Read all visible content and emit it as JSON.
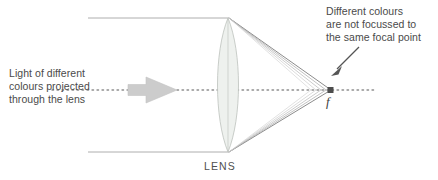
{
  "figure": {
    "background_color": "#ffffff"
  },
  "labels": {
    "left_caption": "Light of different\ncolours projected\nthrough the lens",
    "right_caption": "Different colours\nare not focussed to\nthe same focal point",
    "lens_label": "LENS",
    "focal_label": "f"
  },
  "colors": {
    "text": "#4a4a4a",
    "ray": "#8c8c8c",
    "axis": "#8f8f8f",
    "lens_fill": "#eef1ee",
    "lens_stroke": "#b9bfb9",
    "block_arrow": "#c9c9c9",
    "pointer_arrow": "#555555"
  },
  "geometry": {
    "optical_axis_y": 90,
    "lens_center_x": 228,
    "lens_top_y": 18,
    "lens_bottom_y": 152,
    "lens_half_width": 14,
    "focal_point_x": 331,
    "focal_point_y": 90,
    "incoming_ray_start_x": 88,
    "block_arrow_x": 128,
    "block_arrow_tip_x": 177
  }
}
